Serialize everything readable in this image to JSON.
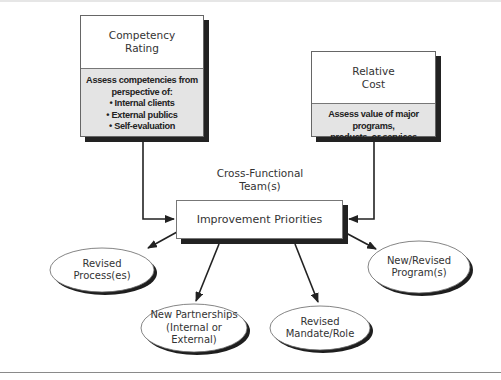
{
  "diagram": {
    "competency_box": {
      "title_line1": "Competency",
      "title_line2": "Rating",
      "desc_line1": "Assess competencies from",
      "desc_line2": "perspective of:",
      "bullets": [
        "Internal clients",
        "External publics",
        "Self-evaluation"
      ]
    },
    "cost_box": {
      "title_line1": "Relative",
      "title_line2": "Cost",
      "desc_line1": "Assess value of major programs,",
      "desc_line2": "products, or services"
    },
    "team_caption": {
      "line1": "Cross-Functional",
      "line2": "Team(s)"
    },
    "priorities_box": {
      "label": "Improvement Priorities"
    },
    "outcomes": [
      {
        "line1": "Revised",
        "line2": "Process(es)",
        "line3": ""
      },
      {
        "line1": "New Partnerships",
        "line2": "(Internal or",
        "line3": "External)"
      },
      {
        "line1": "Revised",
        "line2": "Mandate/Role",
        "line3": ""
      },
      {
        "line1": "New/Revised",
        "line2": "Program(s)",
        "line3": ""
      }
    ],
    "colors": {
      "panel_fill": "#e4e4e4",
      "shadow": "#222222",
      "line": "#222222"
    }
  }
}
